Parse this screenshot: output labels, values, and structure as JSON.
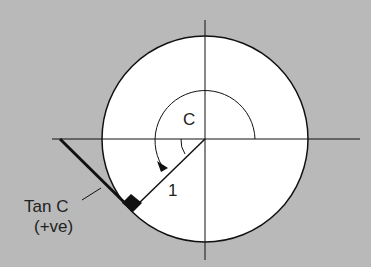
{
  "diagram": {
    "angle_label": "C",
    "radius_label": "1",
    "tan_label_line1": "Tan C",
    "tan_label_line2": "(+ve)",
    "colors": {
      "background": "#b9b9b9",
      "circle_fill": "#ffffff",
      "stroke": "#111111"
    }
  }
}
